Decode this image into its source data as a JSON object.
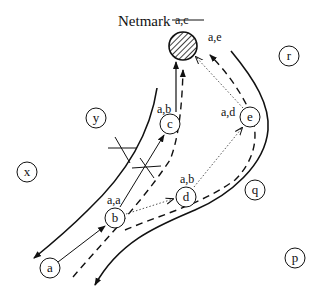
{
  "diagram": {
    "title": "Netmark",
    "title_struck_label": "a,c",
    "title_label": "a,e",
    "target": {
      "name": "netmark-node",
      "fill": "hatched"
    },
    "nodes": [
      {
        "id": "a",
        "label": "a",
        "path": ""
      },
      {
        "id": "b",
        "label": "b",
        "path": "a,a"
      },
      {
        "id": "c",
        "label": "c",
        "path": "a,b"
      },
      {
        "id": "d",
        "label": "d",
        "path": "a,b"
      },
      {
        "id": "e",
        "label": "e",
        "path": "a,d"
      },
      {
        "id": "p",
        "label": "p",
        "path": ""
      },
      {
        "id": "q",
        "label": "q",
        "path": ""
      },
      {
        "id": "r",
        "label": "r",
        "path": ""
      },
      {
        "id": "x",
        "label": "x",
        "path": ""
      },
      {
        "id": "y",
        "label": "y",
        "path": ""
      }
    ],
    "edges": [
      {
        "from": "a",
        "to": "b",
        "style": "solid-arrow"
      },
      {
        "from": "b",
        "to": "c",
        "style": "solid-arrow",
        "blocked": true
      },
      {
        "from": "c",
        "to": "netmark",
        "style": "solid-arrow"
      },
      {
        "from": "b",
        "to": "d",
        "style": "dotted-arrow"
      },
      {
        "from": "d",
        "to": "e",
        "style": "dotted-arrow"
      },
      {
        "from": "e",
        "to": "netmark",
        "style": "dotted-arrow"
      }
    ],
    "route_lines": [
      {
        "style": "solid-curve",
        "description": "left boundary curve with arrow down-left"
      },
      {
        "style": "solid-curve",
        "description": "right boundary curve with arrow down-left"
      },
      {
        "style": "dashed-curve",
        "description": "dashed path up to netmark via c"
      },
      {
        "style": "dashed-curve",
        "description": "dashed path up to netmark via e"
      }
    ],
    "cross_marks": 2
  }
}
